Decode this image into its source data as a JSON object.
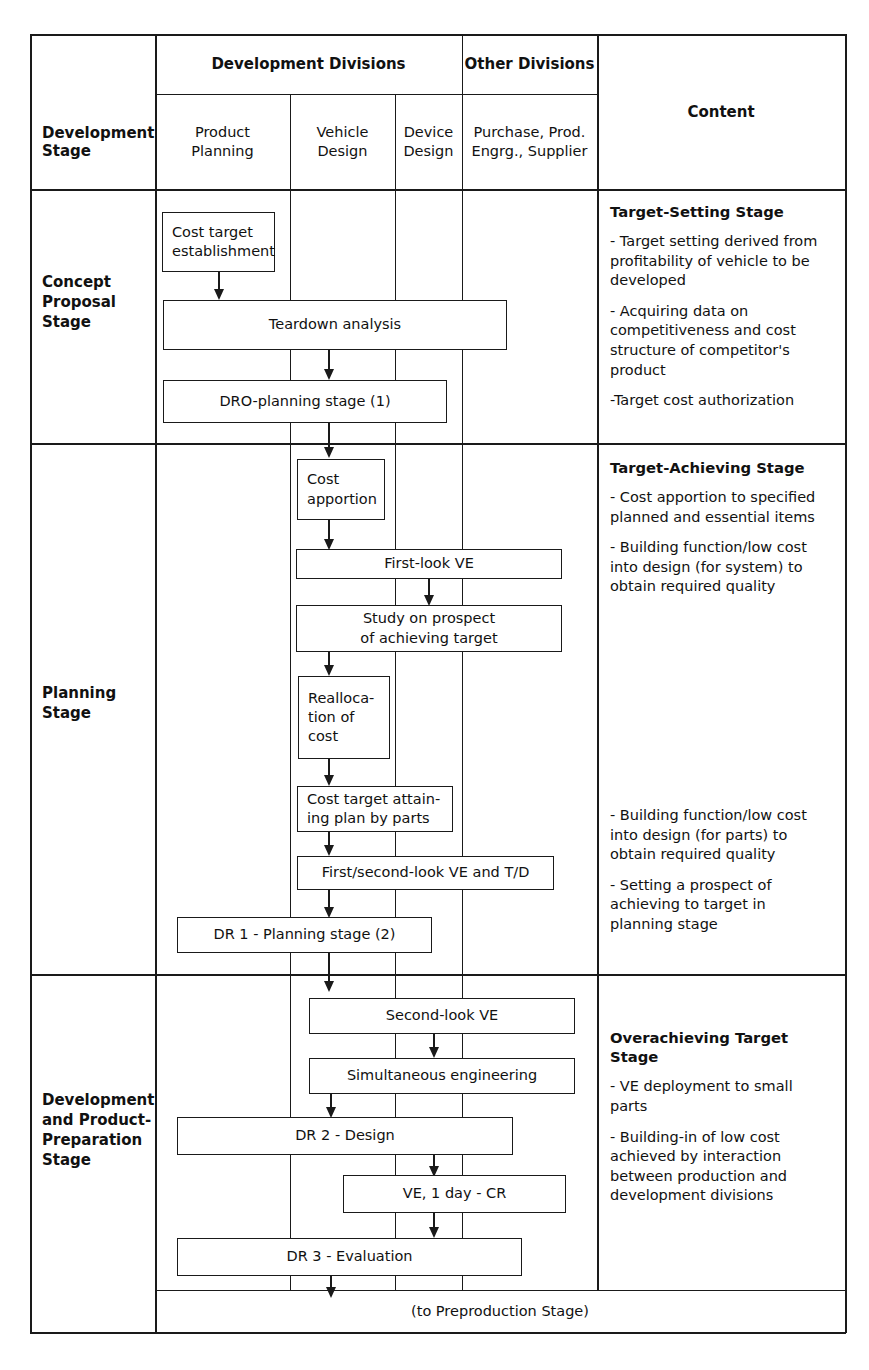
{
  "table": {
    "header": {
      "stage_col": "Development\nStage",
      "group_development": "Development Divisions",
      "group_other": "Other Divisions",
      "col_product_planning": "Product\nPlanning",
      "col_vehicle_design": "Vehicle\nDesign",
      "col_device_design": "Device\nDesign",
      "col_purchase": "Purchase, Prod.\nEngrg., Supplier",
      "col_content": "Content"
    },
    "footer": "(to Preproduction Stage)"
  },
  "stages": [
    {
      "label": "Concept\nProposal\nStage",
      "content_title": "Target-Setting Stage",
      "content_items": [
        "- Target setting derived from\n  profitability of vehicle to be\n  developed",
        "- Acquiring data on\n  competitiveness and cost\n  structure of competitor's\n  product",
        "-Target cost authorization"
      ],
      "boxes": [
        {
          "label": "Cost target\nestablishment"
        },
        {
          "label": "Teardown analysis"
        },
        {
          "label": "DRO-planning stage (1)"
        }
      ]
    },
    {
      "label": "Planning\nStage",
      "content_title": "Target-Achieving Stage",
      "content_items": [
        "- Cost apportion to specified\n  planned and essential items",
        "- Building function/low cost\n  into design (for system) to\n  obtain required quality"
      ],
      "content_items_lower": [
        "- Building function/low cost\n  into design (for parts) to\n  obtain required quality",
        "- Setting a prospect of\n  achieving to target in\n  planning stage"
      ],
      "boxes": [
        {
          "label": "Cost\napportion"
        },
        {
          "label": "First-look VE"
        },
        {
          "label": "Study on prospect\nof achieving target"
        },
        {
          "label": "Realloca-\ntion of\ncost"
        },
        {
          "label": "Cost target attain-\ning plan by parts"
        },
        {
          "label": "First/second-look VE and T/D"
        },
        {
          "label": "DR 1 - Planning stage (2)"
        }
      ]
    },
    {
      "label": "Development\nand Product-\nPreparation\nStage",
      "content_title": "Overachieving Target Stage",
      "content_items": [
        "- VE deployment to small\n  parts",
        "- Building-in of low cost\n  achieved by interaction\n  between production and\n  development divisions"
      ],
      "boxes": [
        {
          "label": "Second-look VE"
        },
        {
          "label": "Simultaneous engineering"
        },
        {
          "label": "DR 2 - Design"
        },
        {
          "label": "VE, 1 day - CR"
        },
        {
          "label": "DR 3 - Evaluation"
        }
      ]
    }
  ]
}
